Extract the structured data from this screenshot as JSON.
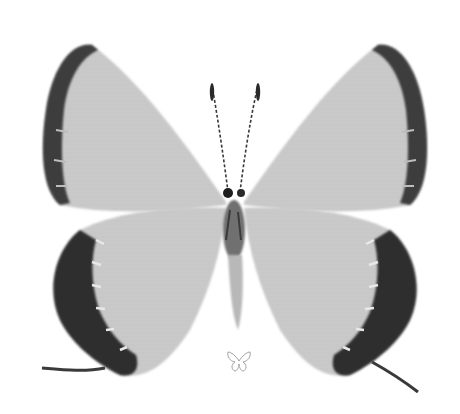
{
  "image": {
    "subject": "butterfly specimen, dorsal view",
    "style": "grayscale photograph",
    "colors": {
      "background": "#ffffff",
      "wing_fill": "#c9c9c9",
      "wing_border": "#3a3a3a",
      "body": "#6a6a6a",
      "mark_stroke": "#9a9a9a"
    }
  },
  "icon": {
    "name": "butterfly-outline-icon"
  }
}
